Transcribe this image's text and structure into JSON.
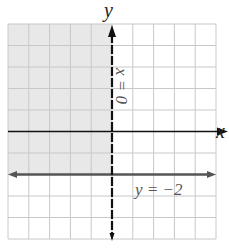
{
  "chart_data": {
    "type": "inequality-region",
    "title": "",
    "xlabel": "x",
    "ylabel": "y",
    "xlim": [
      -5,
      5
    ],
    "ylim": [
      -5,
      5
    ],
    "grid": true,
    "grid_step": 1,
    "tick_labels": false,
    "lines": [
      {
        "equation": "x = 0",
        "label": "x = 0",
        "style": "dashed",
        "orientation": "vertical",
        "value": 0,
        "color": "#111111"
      },
      {
        "equation": "y = -2",
        "label": "y = −2",
        "style": "solid",
        "orientation": "horizontal",
        "value": -2,
        "color": "#555555"
      }
    ],
    "shaded_region": {
      "description": "x < 0 and y > -2",
      "color": "#e8e8e8"
    },
    "colors": {
      "grid": "#c8c8c8",
      "axes": "#111111",
      "shade": "#e8e8e8",
      "boundary": "#555555"
    }
  },
  "labels": {
    "x_axis": "x",
    "y_axis": "y",
    "vertical_line": "x = 0",
    "horizontal_line": "y = −2"
  }
}
